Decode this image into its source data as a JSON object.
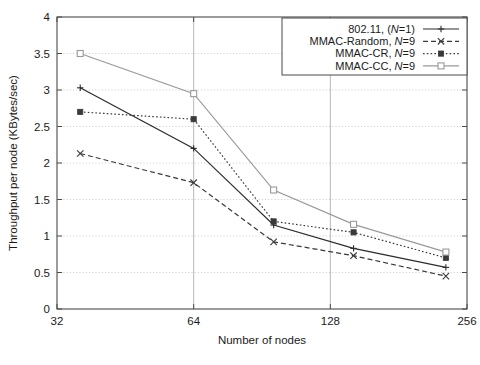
{
  "chart_data": {
    "type": "line",
    "title": "",
    "subtitle": "",
    "xlabel": "Number of nodes",
    "ylabel": "Throughput per node (KBytes/sec)",
    "xscale": "log2",
    "xlim": [
      32,
      256
    ],
    "ylim": [
      0,
      4
    ],
    "xticks": [
      32,
      64,
      128,
      256
    ],
    "xtick_labels": [
      "32",
      "64",
      "128",
      "256"
    ],
    "yticks": [
      0,
      0.5,
      1,
      1.5,
      2,
      2.5,
      3,
      3.5,
      4
    ],
    "ytick_labels": [
      "0",
      "0.5",
      "1",
      "1.5",
      "2",
      "2.5",
      "3",
      "3.5",
      "4"
    ],
    "grid": "both-dotted-horizontal-solid-vertical",
    "legend_position": "top-right",
    "x": [
      36,
      64,
      96,
      144,
      230
    ],
    "series": [
      {
        "name": "802.11, (N=1)",
        "label_main": "802.11, (",
        "label_italic": "N",
        "label_tail": "=1)",
        "marker": "plus",
        "dash": "solid",
        "color": "#2c2c2c",
        "values": [
          3.03,
          2.2,
          1.15,
          0.83,
          0.57
        ]
      },
      {
        "name": "MMAC-Random, N=9",
        "label_main": "MMAC-Random, ",
        "label_italic": "N",
        "label_tail": "=9",
        "marker": "cross",
        "dash": "dashed",
        "color": "#3a3a3a",
        "values": [
          2.13,
          1.73,
          0.92,
          0.73,
          0.45
        ]
      },
      {
        "name": "MMAC-CR, N=9",
        "label_main": "MMAC-CR, ",
        "label_italic": "N",
        "label_tail": "=9",
        "marker": "filled-square",
        "dash": "dotted",
        "color": "#3a3a3a",
        "values": [
          2.7,
          2.6,
          1.2,
          1.05,
          0.7
        ]
      },
      {
        "name": "MMAC-CC, N=9",
        "label_main": "MMAC-CC, ",
        "label_italic": "N",
        "label_tail": "=9",
        "marker": "open-square",
        "dash": "solid",
        "color": "#9a9a9a",
        "values": [
          3.5,
          2.95,
          1.63,
          1.16,
          0.78
        ]
      }
    ]
  },
  "axes": {
    "x_title": "Number of nodes",
    "y_title": "Throughput per node (KBytes/sec)"
  },
  "legend": {
    "entries": [
      "802.11, (N=1)",
      "MMAC-Random, N=9",
      "MMAC-CR, N=9",
      "MMAC-CC, N=9"
    ]
  },
  "colors": {
    "frame": "#4a4a4a",
    "grid_h": "#c9c9c9",
    "grid_v": "#b8b8b8",
    "text": "#1a1a1a",
    "series_dark": "#2c2c2c",
    "series_gray": "#9a9a9a"
  }
}
